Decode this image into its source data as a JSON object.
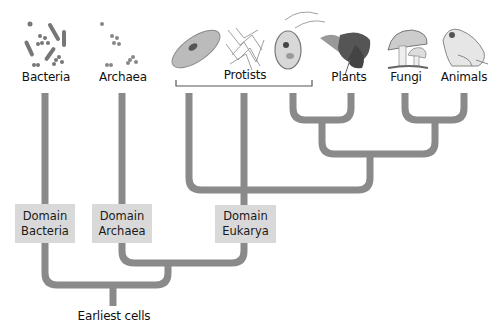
{
  "groups": [
    {
      "id": "bacteria",
      "label": "Bacteria",
      "x": 45,
      "icon": "bacteria-icon"
    },
    {
      "id": "archaea",
      "label": "Archaea",
      "x": 122,
      "icon": "archaea-icon"
    },
    {
      "id": "protists",
      "label": "Protists",
      "x": 244,
      "icon": "protists-icon"
    },
    {
      "id": "plants",
      "label": "Plants",
      "x": 351,
      "icon": "plant-icon"
    },
    {
      "id": "fungi",
      "label": "Fungi",
      "x": 405,
      "icon": "mushroom-icon"
    },
    {
      "id": "animals",
      "label": "Animals",
      "x": 464,
      "icon": "frog-icon"
    }
  ],
  "labels": {
    "bacteria": "Bacteria",
    "archaea": "Archaea",
    "protists": "Protists",
    "plants": "Plants",
    "fungi": "Fungi",
    "animals": "Animals",
    "root": "Earliest cells"
  },
  "domains": {
    "bacteria": {
      "line1": "Domain",
      "line2": "Bacteria"
    },
    "archaea": {
      "line1": "Domain",
      "line2": "Archaea"
    },
    "eukarya": {
      "line1": "Domain",
      "line2": "Eukarya"
    }
  },
  "colors": {
    "branch": "#8a8a8a",
    "domain_box": "#d9d9d9",
    "text": "#111111"
  }
}
